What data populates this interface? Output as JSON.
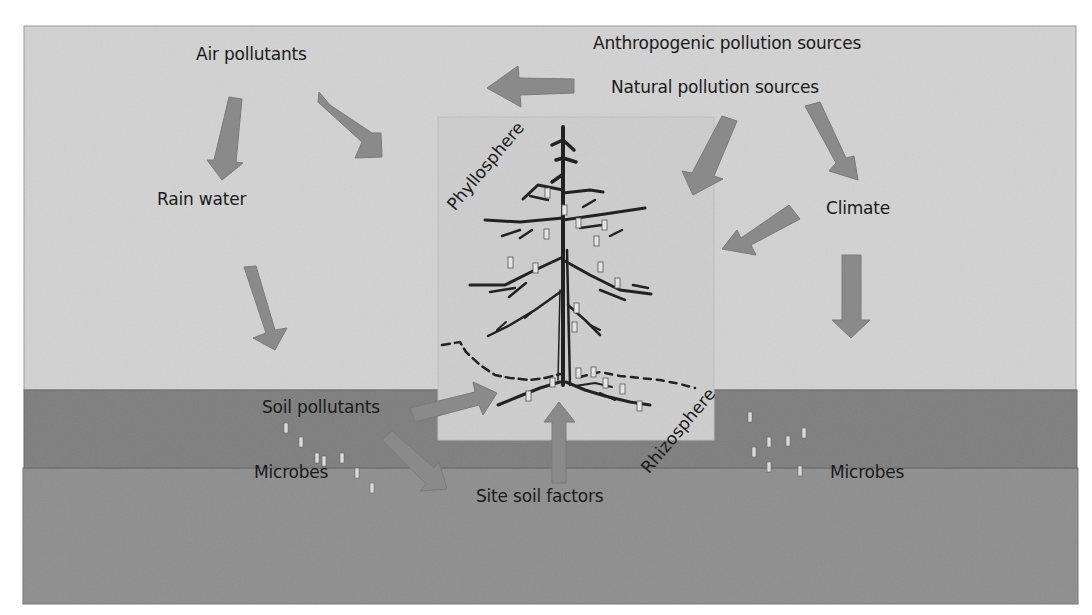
{
  "colors": {
    "sky": "#d2d2d2",
    "tree_box": "#cdcdcd",
    "soil_top": "#7e7e7e",
    "soil_bottom": "#8e8e8e",
    "arrow": "#8a8a8a",
    "arrow_edge": "#777777",
    "microbe": "#e2e2e2",
    "tree_ink": "#222222",
    "text": "#1a1a1a"
  },
  "labels": {
    "air_pollutants": "Air pollutants",
    "anthropogenic": "Anthropogenic pollution sources",
    "natural": "Natural pollution sources",
    "rain_water": "Rain water",
    "climate": "Climate",
    "phyllosphere": "Phyllosphere",
    "rhizosphere": "Rhizosphere",
    "soil_pollutants": "Soil pollutants",
    "microbes_left": "Microbes",
    "microbes_right": "Microbes",
    "site_soil_factors": "Site soil factors"
  },
  "arrows": [
    {
      "id": "anthropogenic-to-air",
      "from": "Anthropogenic pollution sources",
      "to": "Air pollutants"
    },
    {
      "id": "air-to-rain",
      "from": "Air pollutants",
      "to": "Rain water"
    },
    {
      "id": "air-to-phyllosphere",
      "from": "Air pollutants",
      "to": "Phyllosphere"
    },
    {
      "id": "rain-to-soil",
      "from": "Rain water",
      "to": "Soil"
    },
    {
      "id": "natural-to-phyllosphere",
      "from": "Natural pollution sources",
      "to": "Phyllosphere"
    },
    {
      "id": "natural-to-climate",
      "from": "Natural pollution sources",
      "to": "Climate"
    },
    {
      "id": "climate-to-phyllosphere",
      "from": "Climate",
      "to": "Phyllosphere"
    },
    {
      "id": "climate-to-soil",
      "from": "Climate",
      "to": "Soil"
    },
    {
      "id": "soil-pollutants-to-rhizosphere",
      "from": "Soil pollutants",
      "to": "Rhizosphere"
    },
    {
      "id": "soil-pollutants-to-site-soil",
      "from": "Soil pollutants",
      "to": "Site soil factors"
    },
    {
      "id": "site-soil-to-rhizosphere",
      "from": "Site soil factors",
      "to": "Rhizosphere"
    }
  ]
}
